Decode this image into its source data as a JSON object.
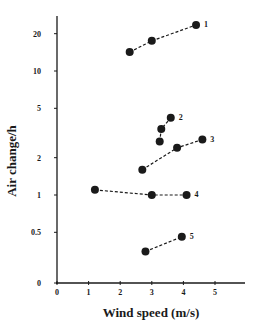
{
  "chart_data": {
    "type": "scatter",
    "title": "",
    "xlabel": "Wind speed (m/s)",
    "ylabel": "Air change/h",
    "x_ticks": [
      "0",
      "1",
      "2",
      "3",
      "4",
      "5"
    ],
    "y_ticks": [
      "0",
      "0.5",
      "1",
      "2",
      "5",
      "10",
      "20"
    ],
    "xlim": [
      0,
      6
    ],
    "y_scale": "log",
    "ylim": [
      0,
      30
    ],
    "grid": false,
    "legend": "none (series labelled 1–5 at line ends)",
    "line_style": "dashed",
    "marker": "filled circle",
    "series": [
      {
        "name": "1",
        "x": [
          2.3,
          3.0,
          4.4
        ],
        "y": [
          14.2,
          17.5,
          23.5
        ]
      },
      {
        "name": "2",
        "x": [
          3.25,
          3.3,
          3.6
        ],
        "y": [
          2.7,
          3.4,
          4.2
        ]
      },
      {
        "name": "3",
        "x": [
          2.7,
          3.8,
          4.6
        ],
        "y": [
          1.6,
          2.4,
          2.8
        ]
      },
      {
        "name": "4",
        "x": [
          1.2,
          3.0,
          4.1
        ],
        "y": [
          1.1,
          1.0,
          1.0
        ]
      },
      {
        "name": "5",
        "x": [
          2.8,
          3.95
        ],
        "y": [
          0.35,
          0.46
        ]
      }
    ]
  },
  "colors": {
    "ink": "#1a1a1a",
    "background": "#ffffff"
  }
}
